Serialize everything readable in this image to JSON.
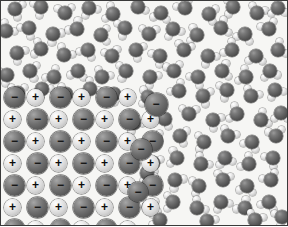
{
  "figure": {
    "width": 288,
    "height": 226,
    "border_color": "#3a3a3a",
    "background_color": "#f6f6f4"
  },
  "legend": {
    "negative_ion_label": "−",
    "positive_ion_label": "+",
    "negative_ion_color": "#6e6e6e",
    "positive_ion_color": "#d8d8d8",
    "oxygen_color": "#5e5e5e",
    "hydrogen_color": "#d2d2d2"
  },
  "crystal": {
    "name": "ionic-lattice",
    "columns": 7,
    "rows": 7,
    "spacing_x": 23,
    "spacing_y": 22,
    "origin_x": 3,
    "origin_y": 96,
    "negative_radius": 10.5,
    "positive_radius": 8.5,
    "negative_font_size": 12,
    "positive_font_size": 12,
    "grid": [
      [
        "neg",
        "pos",
        "neg",
        "pos",
        "neg",
        "pos",
        "none"
      ],
      [
        "pos",
        "neg",
        "pos",
        "neg",
        "pos",
        "neg",
        "pos"
      ],
      [
        "neg",
        "pos",
        "neg",
        "pos",
        "neg",
        "pos",
        "neg"
      ],
      [
        "pos",
        "neg",
        "pos",
        "neg",
        "pos",
        "neg",
        "pos"
      ],
      [
        "neg",
        "pos",
        "neg",
        "pos",
        "neg",
        "pos",
        "neg"
      ],
      [
        "pos",
        "neg",
        "pos",
        "neg",
        "pos",
        "neg",
        "pos"
      ],
      [
        "neg",
        "pos",
        "neg",
        "pos",
        "neg",
        "pos",
        "none"
      ]
    ],
    "detached_ions": [
      {
        "x": 155,
        "y": 103,
        "type": "neg",
        "r": 11.5
      },
      {
        "x": 140,
        "y": 148,
        "type": "neg",
        "r": 10.5
      },
      {
        "x": 137,
        "y": 191,
        "type": "neg",
        "r": 10.0
      }
    ]
  },
  "water": {
    "name": "water-molecules",
    "oxygen_radius": 7.2,
    "hydrogen_radius": 3.6,
    "bond_length": 8.4,
    "bond_angle_deg": 104,
    "molecules": [
      {
        "x": 14,
        "y": 8,
        "rot": 20
      },
      {
        "x": 40,
        "y": 6,
        "rot": 155
      },
      {
        "x": 64,
        "y": 12,
        "rot": 265
      },
      {
        "x": 88,
        "y": 7,
        "rot": 60
      },
      {
        "x": 112,
        "y": 13,
        "rot": 200
      },
      {
        "x": 137,
        "y": 6,
        "rot": 330
      },
      {
        "x": 160,
        "y": 12,
        "rot": 100
      },
      {
        "x": 184,
        "y": 7,
        "rot": 240
      },
      {
        "x": 208,
        "y": 13,
        "rot": 15
      },
      {
        "x": 232,
        "y": 6,
        "rot": 175
      },
      {
        "x": 256,
        "y": 12,
        "rot": 290
      },
      {
        "x": 277,
        "y": 7,
        "rot": 85
      },
      {
        "x": 5,
        "y": 30,
        "rot": 310
      },
      {
        "x": 28,
        "y": 27,
        "rot": 130
      },
      {
        "x": 52,
        "y": 33,
        "rot": 45
      },
      {
        "x": 76,
        "y": 28,
        "rot": 225
      },
      {
        "x": 100,
        "y": 34,
        "rot": 0
      },
      {
        "x": 124,
        "y": 27,
        "rot": 160
      },
      {
        "x": 148,
        "y": 33,
        "rot": 275
      },
      {
        "x": 172,
        "y": 28,
        "rot": 70
      },
      {
        "x": 196,
        "y": 34,
        "rot": 190
      },
      {
        "x": 220,
        "y": 27,
        "rot": 340
      },
      {
        "x": 244,
        "y": 33,
        "rot": 110
      },
      {
        "x": 268,
        "y": 28,
        "rot": 250
      },
      {
        "x": 16,
        "y": 52,
        "rot": 35
      },
      {
        "x": 40,
        "y": 48,
        "rot": 195
      },
      {
        "x": 63,
        "y": 54,
        "rot": 305
      },
      {
        "x": 87,
        "y": 49,
        "rot": 120
      },
      {
        "x": 111,
        "y": 55,
        "rot": 255
      },
      {
        "x": 135,
        "y": 49,
        "rot": 25
      },
      {
        "x": 159,
        "y": 55,
        "rot": 145
      },
      {
        "x": 183,
        "y": 49,
        "rot": 285
      },
      {
        "x": 207,
        "y": 55,
        "rot": 55
      },
      {
        "x": 231,
        "y": 49,
        "rot": 215
      },
      {
        "x": 255,
        "y": 55,
        "rot": 95
      },
      {
        "x": 277,
        "y": 49,
        "rot": 330
      },
      {
        "x": 6,
        "y": 74,
        "rot": 150
      },
      {
        "x": 29,
        "y": 70,
        "rot": 10
      },
      {
        "x": 53,
        "y": 76,
        "rot": 230
      },
      {
        "x": 77,
        "y": 70,
        "rot": 100
      },
      {
        "x": 101,
        "y": 76,
        "rot": 300
      },
      {
        "x": 125,
        "y": 70,
        "rot": 170
      },
      {
        "x": 149,
        "y": 76,
        "rot": 40
      },
      {
        "x": 173,
        "y": 70,
        "rot": 260
      },
      {
        "x": 197,
        "y": 76,
        "rot": 130
      },
      {
        "x": 221,
        "y": 70,
        "rot": 350
      },
      {
        "x": 245,
        "y": 76,
        "rot": 210
      },
      {
        "x": 269,
        "y": 70,
        "rot": 80
      },
      {
        "x": 17,
        "y": 92,
        "rot": 270
      },
      {
        "x": 41,
        "y": 88,
        "rot": 50
      },
      {
        "x": 65,
        "y": 93,
        "rot": 185
      },
      {
        "x": 89,
        "y": 88,
        "rot": 320
      },
      {
        "x": 113,
        "y": 93,
        "rot": 140
      },
      {
        "x": 178,
        "y": 90,
        "rot": 230
      },
      {
        "x": 202,
        "y": 95,
        "rot": 20
      },
      {
        "x": 226,
        "y": 89,
        "rot": 160
      },
      {
        "x": 250,
        "y": 95,
        "rot": 295
      },
      {
        "x": 274,
        "y": 89,
        "rot": 65
      },
      {
        "x": 164,
        "y": 118,
        "rot": 115
      },
      {
        "x": 188,
        "y": 113,
        "rot": 275
      },
      {
        "x": 212,
        "y": 119,
        "rot": 35
      },
      {
        "x": 236,
        "y": 113,
        "rot": 200
      },
      {
        "x": 260,
        "y": 119,
        "rot": 330
      },
      {
        "x": 280,
        "y": 112,
        "rot": 90
      },
      {
        "x": 155,
        "y": 140,
        "rot": 245
      },
      {
        "x": 179,
        "y": 135,
        "rot": 15
      },
      {
        "x": 203,
        "y": 141,
        "rot": 175
      },
      {
        "x": 227,
        "y": 135,
        "rot": 300
      },
      {
        "x": 251,
        "y": 141,
        "rot": 120
      },
      {
        "x": 275,
        "y": 135,
        "rot": 260
      },
      {
        "x": 152,
        "y": 162,
        "rot": 30
      },
      {
        "x": 176,
        "y": 157,
        "rot": 190
      },
      {
        "x": 200,
        "y": 163,
        "rot": 310
      },
      {
        "x": 224,
        "y": 157,
        "rot": 75
      },
      {
        "x": 248,
        "y": 163,
        "rot": 215
      },
      {
        "x": 272,
        "y": 157,
        "rot": 140
      },
      {
        "x": 150,
        "y": 184,
        "rot": 265
      },
      {
        "x": 174,
        "y": 179,
        "rot": 45
      },
      {
        "x": 198,
        "y": 185,
        "rot": 165
      },
      {
        "x": 222,
        "y": 179,
        "rot": 285
      },
      {
        "x": 246,
        "y": 185,
        "rot": 100
      },
      {
        "x": 270,
        "y": 179,
        "rot": 240
      },
      {
        "x": 148,
        "y": 206,
        "rot": 10
      },
      {
        "x": 172,
        "y": 201,
        "rot": 180
      },
      {
        "x": 196,
        "y": 207,
        "rot": 320
      },
      {
        "x": 220,
        "y": 201,
        "rot": 60
      },
      {
        "x": 244,
        "y": 207,
        "rot": 225
      },
      {
        "x": 268,
        "y": 201,
        "rot": 110
      },
      {
        "x": 159,
        "y": 219,
        "rot": 200
      },
      {
        "x": 206,
        "y": 220,
        "rot": 40
      },
      {
        "x": 254,
        "y": 219,
        "rot": 290
      },
      {
        "x": 281,
        "y": 216,
        "rot": 150
      },
      {
        "x": 147,
        "y": 96,
        "rot": 185
      },
      {
        "x": 133,
        "y": 122,
        "rot": 55
      },
      {
        "x": 146,
        "y": 172,
        "rot": 330
      }
    ]
  }
}
